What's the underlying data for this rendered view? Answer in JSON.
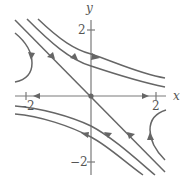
{
  "diagram": {
    "colors": {
      "curve": "#666666",
      "axis": "#7a7a7a",
      "label": "#555555",
      "background": "#ffffff"
    },
    "axes": {
      "x_label": "x",
      "y_label": "y",
      "x_ticks": [
        {
          "value": -2,
          "label": "−2"
        },
        {
          "value": 2,
          "label": "2"
        }
      ],
      "y_ticks": [
        {
          "value": 2,
          "label": "2"
        },
        {
          "value": -2,
          "label": "−2"
        }
      ],
      "x_range": [
        -2.3,
        2.3
      ],
      "y_range": [
        -2.4,
        2.3
      ]
    },
    "equilibrium": {
      "x": 0,
      "y": 0,
      "type": "saddle"
    },
    "eigen_lines": [
      {
        "name": "unstable-x-axis",
        "direction": "outward",
        "equation": "y = 0"
      },
      {
        "name": "stable-diagonal",
        "direction": "inward",
        "equation": "y = -x"
      }
    ],
    "trajectories": [
      {
        "name": "upper-right-outer",
        "direction": "left-to-right"
      },
      {
        "name": "upper-right-inner",
        "direction": "left-to-right"
      },
      {
        "name": "lower-left-upper",
        "direction": "right-to-left"
      },
      {
        "name": "lower-left-lower",
        "direction": "right-to-left"
      },
      {
        "name": "left-hyperbola",
        "direction": "downward"
      },
      {
        "name": "right-hyperbola",
        "direction": "upward"
      }
    ]
  }
}
